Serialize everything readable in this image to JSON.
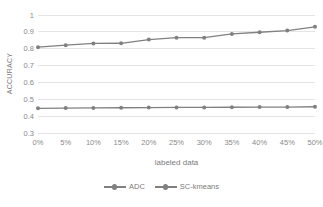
{
  "chart_data": {
    "type": "line",
    "title": "",
    "xlabel": "labeled data",
    "ylabel": "ACCURACY",
    "categories": [
      "0%",
      "5%",
      "10%",
      "15%",
      "20%",
      "25%",
      "30%",
      "35%",
      "40%",
      "45%",
      "50%"
    ],
    "ylim": [
      0.3,
      1
    ],
    "ytick_labels": [
      "1",
      "0.9",
      "0.8",
      "0.7",
      "0.6",
      "0.5",
      "0.4",
      "0.3"
    ],
    "ytick_values": [
      1,
      0.9,
      0.8,
      0.7,
      0.6,
      0.5,
      0.4,
      0.3
    ],
    "grid": true,
    "legend_position": "bottom",
    "series": [
      {
        "name": "ADC",
        "color": "#808080",
        "marker": "circle",
        "values": [
          0.81,
          0.822,
          0.832,
          0.833,
          0.855,
          0.866,
          0.866,
          0.888,
          0.898,
          0.908,
          0.93
        ]
      },
      {
        "name": "SC-kmeans",
        "color": "#808080",
        "marker": "circle",
        "values": [
          0.449,
          0.45,
          0.451,
          0.452,
          0.453,
          0.454,
          0.454,
          0.455,
          0.456,
          0.456,
          0.458
        ]
      }
    ]
  },
  "axis": {
    "x_title": "labeled data",
    "y_title": "ACCURACY"
  },
  "legend": {
    "items": [
      {
        "label": "ADC"
      },
      {
        "label": "SC-kmeans"
      }
    ]
  },
  "colors": {
    "series_line": "#808080",
    "gridline": "#e4e4e4",
    "text": "#7b7b7b",
    "background": "#ffffff"
  }
}
